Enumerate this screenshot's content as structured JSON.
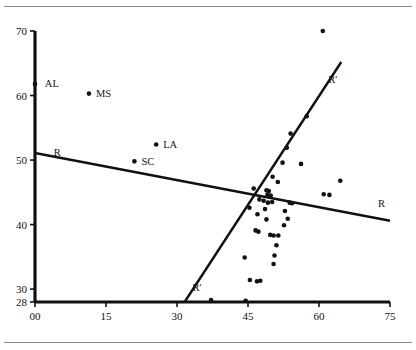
{
  "figure": {
    "title": "",
    "top_rule": "top-horizontal-rule",
    "bottom_rule": "bottom-horizontal-rule"
  },
  "chart_data": {
    "type": "scatter",
    "title": "",
    "xlabel": "",
    "ylabel": "",
    "xlim": [
      0,
      75
    ],
    "ylim": [
      28,
      70
    ],
    "grid": false,
    "legend": "none",
    "xticks": [
      0,
      15,
      30,
      45,
      60,
      75
    ],
    "xtick_labels": [
      "00",
      "15",
      "30",
      "45",
      "60",
      "75"
    ],
    "yticks": [
      28,
      30,
      40,
      50,
      60,
      70
    ],
    "ytick_labels": [
      "28",
      "30",
      "40",
      "50",
      "60",
      "70"
    ],
    "annotations": [
      {
        "text": "AL",
        "x": 0.6,
        "y": 61.8
      },
      {
        "text": "MS",
        "x": 11.4,
        "y": 60.3
      },
      {
        "text": "LA",
        "x": 25.6,
        "y": 52.4
      },
      {
        "text": "SC",
        "x": 21.0,
        "y": 49.8
      },
      {
        "text": "R",
        "x": 2.5,
        "y": 51.2
      },
      {
        "text": "R",
        "x": 71.0,
        "y": 43.2
      },
      {
        "text": "R'",
        "x": 31.8,
        "y": 30.2
      },
      {
        "text": "R'",
        "x": 60.5,
        "y": 62.5
      }
    ],
    "labeled_points": [
      {
        "label": "AL",
        "x": 0.0,
        "y": 61.8
      },
      {
        "label": "MS",
        "x": 11.4,
        "y": 60.3
      },
      {
        "label": "LA",
        "x": 25.6,
        "y": 52.4
      },
      {
        "label": "SC",
        "x": 21.0,
        "y": 49.8
      }
    ],
    "points": [
      {
        "x": 60.8,
        "y": 70.0
      },
      {
        "x": 57.4,
        "y": 56.8
      },
      {
        "x": 54.0,
        "y": 54.1
      },
      {
        "x": 53.2,
        "y": 51.9
      },
      {
        "x": 52.3,
        "y": 49.6
      },
      {
        "x": 56.2,
        "y": 49.4
      },
      {
        "x": 50.2,
        "y": 47.4
      },
      {
        "x": 51.3,
        "y": 46.6
      },
      {
        "x": 64.5,
        "y": 46.8
      },
      {
        "x": 61.0,
        "y": 44.7
      },
      {
        "x": 62.2,
        "y": 44.6
      },
      {
        "x": 46.2,
        "y": 45.6
      },
      {
        "x": 48.9,
        "y": 45.3
      },
      {
        "x": 49.4,
        "y": 45.2
      },
      {
        "x": 49.1,
        "y": 44.6
      },
      {
        "x": 49.8,
        "y": 44.5
      },
      {
        "x": 47.4,
        "y": 43.9
      },
      {
        "x": 48.3,
        "y": 43.7
      },
      {
        "x": 49.2,
        "y": 43.4
      },
      {
        "x": 50.1,
        "y": 43.5
      },
      {
        "x": 53.8,
        "y": 43.4
      },
      {
        "x": 54.3,
        "y": 43.3
      },
      {
        "x": 45.3,
        "y": 42.6
      },
      {
        "x": 48.6,
        "y": 42.4
      },
      {
        "x": 52.8,
        "y": 42.1
      },
      {
        "x": 47.0,
        "y": 41.6
      },
      {
        "x": 53.4,
        "y": 40.9
      },
      {
        "x": 48.9,
        "y": 40.8
      },
      {
        "x": 52.6,
        "y": 39.9
      },
      {
        "x": 46.6,
        "y": 39.1
      },
      {
        "x": 47.2,
        "y": 38.9
      },
      {
        "x": 49.7,
        "y": 38.4
      },
      {
        "x": 50.4,
        "y": 38.3
      },
      {
        "x": 51.4,
        "y": 38.3
      },
      {
        "x": 51.0,
        "y": 36.8
      },
      {
        "x": 50.6,
        "y": 35.2
      },
      {
        "x": 44.3,
        "y": 34.9
      },
      {
        "x": 50.4,
        "y": 33.9
      },
      {
        "x": 45.4,
        "y": 31.4
      },
      {
        "x": 46.9,
        "y": 31.2
      },
      {
        "x": 47.6,
        "y": 31.3
      },
      {
        "x": 44.5,
        "y": 28.2
      },
      {
        "x": 37.2,
        "y": 28.3
      }
    ],
    "lines": [
      {
        "name": "R",
        "label": "R",
        "x1": 0.0,
        "y1": 51.1,
        "x2": 75.0,
        "y2": 40.6
      },
      {
        "name": "R-prime",
        "label": "R'",
        "x1": 31.6,
        "y1": 28.0,
        "x2": 64.7,
        "y2": 65.2
      }
    ],
    "style": {
      "marker": "circle",
      "marker_color": "#111111",
      "line_color": "#111111",
      "axis_color": "#111111",
      "background": "#ffffff"
    }
  }
}
